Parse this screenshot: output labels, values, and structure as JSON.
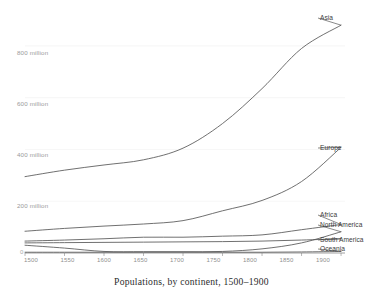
{
  "chart_data": {
    "type": "line",
    "title": "Populations, by continent, 1500–1900",
    "xlabel": "",
    "ylabel": "",
    "grid": true,
    "legend_position": "right-line-end",
    "x": [
      1500,
      1550,
      1600,
      1650,
      1700,
      1750,
      1800,
      1850,
      1900
    ],
    "xlim": [
      1500,
      1905
    ],
    "ylim": [
      0,
      900
    ],
    "xticks": [
      "1500",
      "1550",
      "1600",
      "1650",
      "1700",
      "1750",
      "1800",
      "1850",
      "1900"
    ],
    "yticks": [
      "0",
      "200 million",
      "400 million",
      "600 million",
      "800 million"
    ],
    "ytick_values": [
      0,
      200,
      400,
      600,
      800
    ],
    "units": "millions of people",
    "series": [
      {
        "name": "Asia",
        "values": [
          295,
          320,
          340,
          360,
          405,
          500,
          635,
          790,
          880
        ]
      },
      {
        "name": "Europe",
        "values": [
          84,
          95,
          104,
          112,
          125,
          163,
          203,
          276,
          408
        ]
      },
      {
        "name": "Africa",
        "values": [
          46,
          50,
          55,
          61,
          61,
          65,
          70,
          90,
          110
        ]
      },
      {
        "name": "North America",
        "values": [
          30,
          19,
          6,
          5,
          5,
          6,
          16,
          39,
          82
        ]
      },
      {
        "name": "South America",
        "values": [
          39,
          40,
          41,
          42,
          43,
          44,
          46,
          50,
          55
        ]
      },
      {
        "name": "Oceania",
        "values": [
          3,
          3,
          3,
          3,
          3,
          3,
          3,
          4,
          6
        ]
      }
    ]
  },
  "labels": {
    "asia": "Asia",
    "europe": "Europe",
    "africa": "Africa",
    "north_america": "North America",
    "south_america": "South America",
    "oceania": "Oceania"
  },
  "axis": {
    "y0": "0",
    "y200": "200 million",
    "y400": "400 million",
    "y600": "600 million",
    "y800": "800 million",
    "x1500": "1500",
    "x1550": "1550",
    "x1600": "1600",
    "x1650": "1650",
    "x1700": "1700",
    "x1750": "1750",
    "x1800": "1800",
    "x1850": "1850",
    "x1900": "1900"
  },
  "colors": {
    "line": "#565656",
    "grid": "#ececec",
    "axis": "#7a7a7a",
    "ylabel_text": "#9a9a9a",
    "xlabel_text": "#8f8f8f",
    "title_text": "#2c2c2c",
    "background": "#ffffff"
  }
}
